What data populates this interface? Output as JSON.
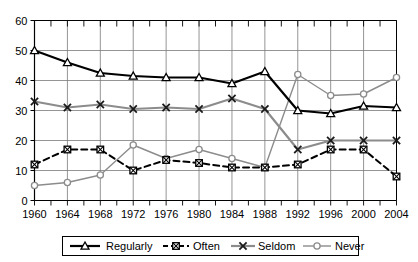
{
  "chart_data": {
    "type": "line",
    "title": "",
    "subtitle": "",
    "xlabel": "",
    "ylabel": "",
    "x": [
      1960,
      1964,
      1968,
      1972,
      1976,
      1980,
      1984,
      1988,
      1992,
      1996,
      2000,
      2004
    ],
    "xticklabels": [
      "1960",
      "1964",
      "1968",
      "1972",
      "1976",
      "1980",
      "1984",
      "1988",
      "1992",
      "1996",
      "2000",
      "2004"
    ],
    "yticklabels": [
      "0",
      "10",
      "20",
      "30",
      "40",
      "50",
      "60"
    ],
    "yticks": [
      0,
      10,
      20,
      30,
      40,
      50,
      60
    ],
    "xlim": [
      1960,
      2004
    ],
    "ylim": [
      0,
      60
    ],
    "grid": true,
    "legend_position": "bottom",
    "minor_xticks_interval": 2,
    "series": [
      {
        "name": "Regularly",
        "values": [
          50,
          46,
          42.5,
          41.5,
          41,
          41,
          39,
          43,
          30,
          29,
          31.5,
          31
        ],
        "color": "#000000",
        "marker": "triangle",
        "dash": "solid",
        "width": 2.2
      },
      {
        "name": "Often",
        "values": [
          12,
          17,
          17,
          10,
          13.5,
          12.5,
          11,
          11,
          12,
          17,
          17,
          8
        ],
        "color": "#000000",
        "marker": "square",
        "dash": "dashed",
        "width": 2.0
      },
      {
        "name": "Seldom",
        "values": [
          33,
          31,
          32,
          30.5,
          31,
          30.5,
          34,
          30.5,
          17,
          20,
          20,
          20
        ],
        "color": "#8c8c8c",
        "marker": "x",
        "dash": "solid",
        "width": 2.2
      },
      {
        "name": "Never",
        "values": [
          5,
          6,
          8.5,
          18.5,
          14,
          17,
          14,
          11,
          42,
          35,
          35.5,
          41
        ],
        "color": "#8c8c8c",
        "marker": "circle",
        "dash": "solid",
        "width": 1.4
      }
    ]
  },
  "legend": {
    "items": [
      {
        "label": "Regularly"
      },
      {
        "label": "Often"
      },
      {
        "label": "Seldom"
      },
      {
        "label": "Never"
      }
    ]
  },
  "colors": {
    "axis": "#000000",
    "grid": "#7a7a7a",
    "background": "#ffffff",
    "series_dark": "#000000",
    "series_gray": "#8c8c8c"
  }
}
